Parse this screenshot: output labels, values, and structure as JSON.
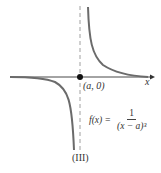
{
  "figure": {
    "caption": "(III)",
    "point_label": "(a, 0)",
    "x_axis_label": "x",
    "function": {
      "lhs": "f(x) =",
      "numerator": "1",
      "denominator": "(x − a)³"
    },
    "colors": {
      "curve": "#6b6b6b",
      "axis": "#333333",
      "asymptote": "#888888",
      "point": "#111111"
    }
  }
}
